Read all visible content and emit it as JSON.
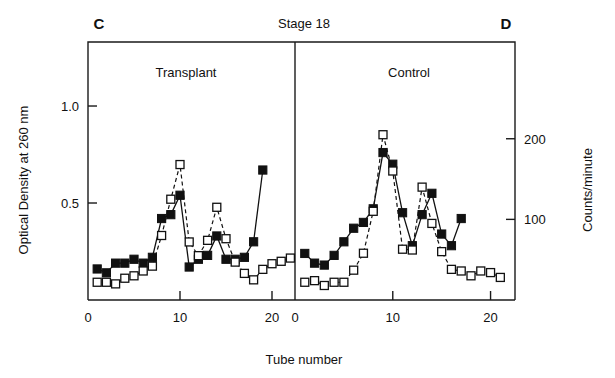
{
  "figure": {
    "title": "Stage 18",
    "xlabel": "Tube number",
    "ylabel_left": "Optical Density at 260 nm",
    "ylabel_right": "Counts/minute",
    "panel_c_letter": "C",
    "panel_d_letter": "D",
    "panel_c_title": "Transplant",
    "panel_d_title": "Control"
  },
  "axis": {
    "x_ticks": [
      "0",
      "10",
      "20"
    ],
    "x_tick_values": [
      0,
      10,
      20
    ],
    "y_left_ticks": [
      "0.5",
      "1.0"
    ],
    "y_left_tick_values": [
      0.5,
      1.0
    ],
    "y_right_ticks": [
      "100",
      "200"
    ],
    "y_right_tick_values": [
      100,
      200
    ]
  },
  "chart_data": {
    "type": "line",
    "title": "Stage 18",
    "xlabel": "Tube number",
    "ylabel": "Optical Density at 260 nm",
    "ylabel_secondary": "Counts/minute",
    "xlim": [
      0,
      22.5
    ],
    "ylim": [
      0,
      1.33
    ],
    "ylim_secondary": [
      0,
      320
    ],
    "grid": false,
    "legend": "none",
    "panels": [
      {
        "letter": "C",
        "name": "Transplant",
        "series": [
          {
            "name": "Optical Density at 260 nm",
            "marker": "filled-square",
            "line": "solid",
            "axis": "left",
            "x": [
              1,
              2,
              3,
              4,
              5,
              6,
              7,
              8,
              9,
              10,
              11,
              12,
              13,
              14,
              15,
              16,
              17,
              18,
              19
            ],
            "values": [
              0.16,
              0.14,
              0.19,
              0.19,
              0.21,
              0.19,
              0.22,
              0.42,
              0.44,
              0.54,
              0.17,
              0.21,
              0.23,
              0.33,
              0.21,
              0.21,
              0.22,
              0.3,
              0.67
            ]
          },
          {
            "name": "Counts/minute",
            "marker": "open-square",
            "line": "dashed",
            "axis": "right",
            "x": [
              1,
              2,
              3,
              4,
              5,
              6,
              7,
              8,
              9,
              10,
              11,
              12,
              13,
              14,
              15,
              16,
              17,
              18,
              19,
              20,
              21,
              22
            ],
            "values": [
              22,
              22,
              20,
              27,
              30,
              36,
              42,
              80,
              125,
              168,
              72,
              55,
              74,
              115,
              76,
              47,
              33,
              25,
              38,
              45,
              48,
              52
            ]
          }
        ]
      },
      {
        "letter": "D",
        "name": "Control",
        "series": [
          {
            "name": "Optical Density at 260 nm",
            "marker": "filled-square",
            "line": "solid",
            "axis": "left",
            "x": [
              1,
              2,
              3,
              4,
              5,
              6,
              7,
              8,
              9,
              10,
              11,
              12,
              13,
              14,
              15,
              16,
              17
            ],
            "values": [
              0.24,
              0.19,
              0.18,
              0.23,
              0.3,
              0.37,
              0.4,
              0.47,
              0.76,
              0.7,
              0.45,
              0.28,
              0.44,
              0.55,
              0.34,
              0.28,
              0.42,
              0.95
            ]
          },
          {
            "name": "Counts/minute",
            "marker": "open-square",
            "line": "dashed",
            "axis": "right",
            "x": [
              1,
              2,
              3,
              4,
              5,
              6,
              7,
              8,
              9,
              10,
              11,
              12,
              13,
              14,
              15,
              16,
              17,
              18,
              19,
              20,
              21
            ],
            "values": [
              22,
              24,
              18,
              22,
              22,
              37,
              58,
              110,
              205,
              160,
              63,
              62,
              140,
              95,
              60,
              38,
              36,
              30,
              36,
              34,
              28
            ]
          }
        ]
      }
    ]
  }
}
